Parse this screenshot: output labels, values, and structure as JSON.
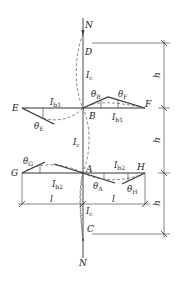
{
  "figure": {
    "type": "frame-column-stability-diagram",
    "axial_load_label": "N",
    "nodes": {
      "D": "D",
      "B": "B",
      "A": "A",
      "C": "C",
      "E": "E",
      "F": "F",
      "G": "G",
      "H": "H"
    },
    "column": {
      "stiffness_label": "I",
      "stiffness_sub": "c"
    },
    "upper_beam": {
      "stiffness_label": "I",
      "stiffness_sub": "b1"
    },
    "lower_beam": {
      "stiffness_label": "I",
      "stiffness_sub": "b2"
    },
    "rotations": {
      "theta": "θ",
      "B": "B",
      "F": "F",
      "E": "E",
      "G": "G",
      "A": "A",
      "H": "H"
    },
    "dimensions": {
      "story_height": "h",
      "beam_span": "l"
    }
  }
}
